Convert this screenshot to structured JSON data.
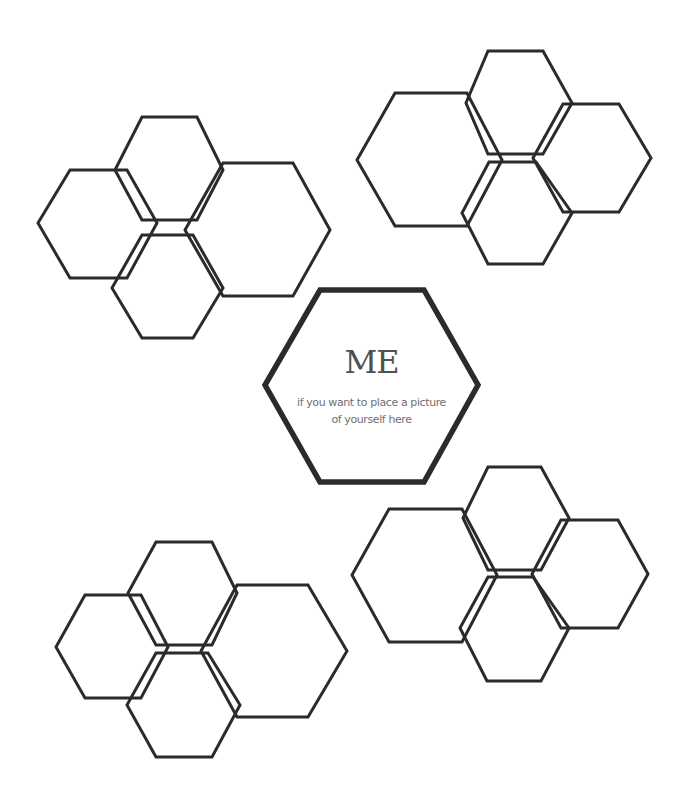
{
  "center": {
    "title": "ME",
    "subtitle_line1": "if you want to place a picture",
    "subtitle_line2": "of  yourself here"
  },
  "colors": {
    "stroke": "#2b2b2b",
    "background": "#ffffff",
    "text": "#555555"
  },
  "clusters": [
    {
      "name": "top-left",
      "hexes": [
        "142,117 197,117 223,170 197,220 142,220 115,170",
        "70,170 127,170 157,223 127,278 70,278 38,223",
        "223,163 293,163 330,230 293,296 223,296 185,230",
        "142,235 193,235 223,288 193,338 142,338 112,288"
      ]
    },
    {
      "name": "top-right",
      "hexes": [
        "395,93 467,93 502,160 467,226 395,226 357,160",
        "488,51 543,51 572,103 543,154 488,154 466,103",
        "563,104 619,104 651,158 619,212 563,212 533,158",
        "489,162 536,162 572,213 543,264 488,264 462,213"
      ]
    },
    {
      "name": "bottom-right",
      "hexes": [
        "389,509 462,509 497,575 462,642 389,642 352,575",
        "488,467 541,467 569,518 541,570 488,570 463,518",
        "561,520 618,520 648,574 618,628 561,628 532,574",
        "488,577 533,577 569,628 541,681 487,681 460,628"
      ]
    },
    {
      "name": "bottom-left",
      "hexes": [
        "156,542 212,542 237,593 212,645 156,645 128,593",
        "85,595 141,595 168,647 141,698 85,698 56,647",
        "237,585 308,585 347,651 308,717 237,717 201,651",
        "156,653 208,653 240,705 212,757 156,757 127,705"
      ]
    }
  ],
  "center_hex": "320,290 424,290 478,385 424,482 320,482 265,385"
}
